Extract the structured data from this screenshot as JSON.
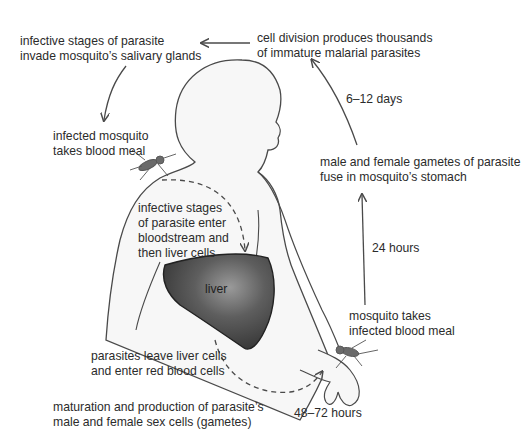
{
  "diagram": {
    "labels": {
      "salivary": {
        "lines": [
          "infective stages of parasite",
          "invade mosquito’s salivary glands"
        ]
      },
      "cell_division": {
        "lines": [
          "cell division produces thousands",
          "of immature malarial parasites"
        ]
      },
      "infected_mosquito": {
        "lines": [
          "infected mosquito",
          "takes blood meal"
        ]
      },
      "days": {
        "text": "6–12 days"
      },
      "gametes_fuse": {
        "lines": [
          "male and female gametes of parasite",
          "fuse in mosquito’s stomach"
        ]
      },
      "bloodstream": {
        "lines": [
          "infective stages",
          "of parasite enter",
          "bloodstream and",
          "then liver cells"
        ]
      },
      "liver": {
        "text": "liver"
      },
      "hours24": {
        "text": "24 hours"
      },
      "mosquito_takes": {
        "lines": [
          "mosquito takes",
          "infected blood meal"
        ]
      },
      "leave_liver": {
        "lines": [
          "parasites leave liver cells",
          "and enter red blood cells"
        ]
      },
      "maturation": {
        "lines": [
          "maturation and production of parasite’s",
          "male and female sex cells (gametes)"
        ]
      },
      "hours48": {
        "text": "48–72 hours"
      }
    },
    "colors": {
      "outline": "#4a4a4a",
      "body_fill": "#f7f7f7",
      "liver_dark": "#3f3f3f",
      "liver_light": "#8a8a8a",
      "arrow": "#4a4a4a"
    }
  }
}
